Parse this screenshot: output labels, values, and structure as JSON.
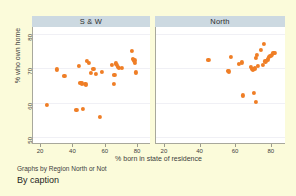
{
  "chart_data": {
    "type": "scatter",
    "title": "",
    "xlabel": "% born in state of residence",
    "ylabel": "% who own home",
    "xlim": [
      15,
      88
    ],
    "ylim": [
      48,
      82
    ],
    "xticks": [
      20,
      40,
      60,
      80
    ],
    "yticks": [
      50,
      60,
      70,
      80
    ],
    "grid": true,
    "legend": "none",
    "marker_color": "#ef7e26",
    "panel_header_color": "#ccd9e1",
    "background_color": "#fbfbda",
    "plot_background_color": "#ffffff",
    "note": "Graphs by Region North or Not",
    "caption": "By caption",
    "panels": [
      {
        "label": "S & W",
        "points": [
          {
            "x": 24.0,
            "y": 59.3
          },
          {
            "x": 30.6,
            "y": 69.7
          },
          {
            "x": 35.0,
            "y": 67.7
          },
          {
            "x": 42.5,
            "y": 57.9
          },
          {
            "x": 43.8,
            "y": 70.8
          },
          {
            "x": 44.9,
            "y": 65.8
          },
          {
            "x": 46.0,
            "y": 65.6
          },
          {
            "x": 46.5,
            "y": 58.3
          },
          {
            "x": 48.0,
            "y": 65.4
          },
          {
            "x": 48.6,
            "y": 65.2
          },
          {
            "x": 49.2,
            "y": 72.2
          },
          {
            "x": 50.2,
            "y": 71.6
          },
          {
            "x": 51.4,
            "y": 68.6
          },
          {
            "x": 53.0,
            "y": 69.8
          },
          {
            "x": 54.3,
            "y": 68.4
          },
          {
            "x": 56.8,
            "y": 55.9
          },
          {
            "x": 58.0,
            "y": 68.9
          },
          {
            "x": 64.6,
            "y": 71.0
          },
          {
            "x": 65.5,
            "y": 65.4
          },
          {
            "x": 66.0,
            "y": 68.0
          },
          {
            "x": 67.0,
            "y": 71.4
          },
          {
            "x": 67.6,
            "y": 70.9
          },
          {
            "x": 68.2,
            "y": 70.4
          },
          {
            "x": 68.9,
            "y": 70.0
          },
          {
            "x": 70.5,
            "y": 70.2
          },
          {
            "x": 77.0,
            "y": 75.1
          },
          {
            "x": 77.5,
            "y": 72.8
          },
          {
            "x": 78.3,
            "y": 72.3
          },
          {
            "x": 78.6,
            "y": 71.5
          },
          {
            "x": 79.5,
            "y": 68.8
          }
        ]
      },
      {
        "label": "North",
        "points": [
          {
            "x": 45.0,
            "y": 72.5
          },
          {
            "x": 55.8,
            "y": 69.3
          },
          {
            "x": 56.6,
            "y": 69.1
          },
          {
            "x": 57.8,
            "y": 73.2
          },
          {
            "x": 62.0,
            "y": 71.3
          },
          {
            "x": 63.8,
            "y": 71.7
          },
          {
            "x": 64.2,
            "y": 62.1
          },
          {
            "x": 69.0,
            "y": 70.4
          },
          {
            "x": 69.5,
            "y": 69.8
          },
          {
            "x": 70.0,
            "y": 69.6
          },
          {
            "x": 70.4,
            "y": 62.9
          },
          {
            "x": 70.8,
            "y": 69.9
          },
          {
            "x": 71.2,
            "y": 70.1
          },
          {
            "x": 71.5,
            "y": 73.0
          },
          {
            "x": 71.8,
            "y": 60.2
          },
          {
            "x": 72.3,
            "y": 74.0
          },
          {
            "x": 73.0,
            "y": 70.6
          },
          {
            "x": 74.5,
            "y": 75.4
          },
          {
            "x": 75.5,
            "y": 70.9
          },
          {
            "x": 76.2,
            "y": 77.2
          },
          {
            "x": 77.0,
            "y": 72.0
          },
          {
            "x": 78.2,
            "y": 72.6
          },
          {
            "x": 79.0,
            "y": 73.2
          },
          {
            "x": 79.8,
            "y": 73.6
          },
          {
            "x": 80.6,
            "y": 74.0
          },
          {
            "x": 81.5,
            "y": 74.4
          },
          {
            "x": 82.5,
            "y": 74.5
          }
        ]
      }
    ]
  }
}
